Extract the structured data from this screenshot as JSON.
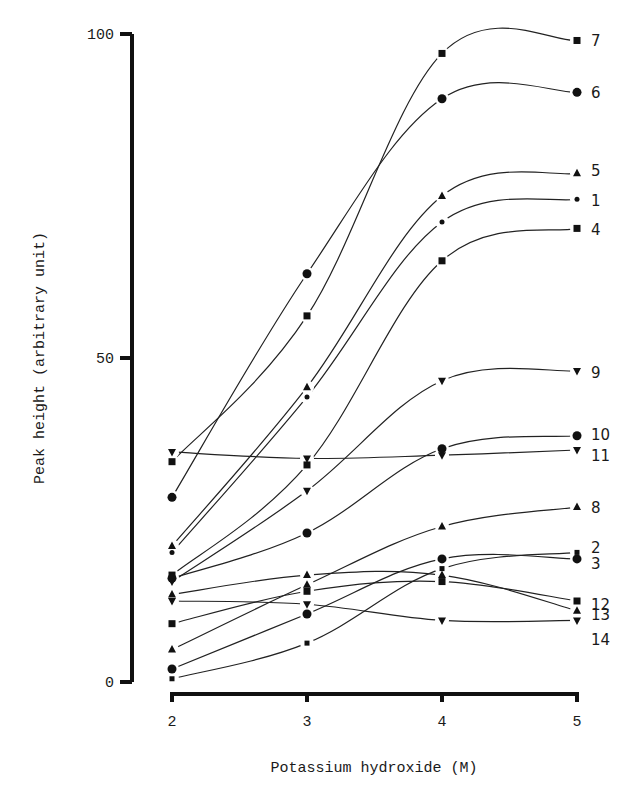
{
  "chart_data": {
    "type": "line",
    "title": "",
    "xlabel": "Potassium hydroxide (M)",
    "ylabel": "Peak height (arbitrary unit)",
    "x": [
      2,
      3,
      4,
      5
    ],
    "xlim": [
      2,
      5
    ],
    "ylim": [
      0,
      100
    ],
    "x_ticks": [
      "2",
      "3",
      "4",
      "5"
    ],
    "y_ticks": [
      "0",
      "50",
      "100"
    ],
    "grid": false,
    "legend": "inline-right",
    "series": [
      {
        "name": "1",
        "marker": "small-circle",
        "values": [
          20,
          44,
          71,
          74.5
        ]
      },
      {
        "name": "2",
        "marker": "small-square",
        "values": [
          0.5,
          6,
          17.5,
          20
        ]
      },
      {
        "name": "3",
        "marker": "circle",
        "values": [
          2,
          10.5,
          19,
          19
        ]
      },
      {
        "name": "4",
        "marker": "square",
        "values": [
          16.5,
          33.5,
          65,
          70
        ]
      },
      {
        "name": "5",
        "marker": "triangle-up",
        "values": [
          21,
          45.5,
          75,
          78.5
        ]
      },
      {
        "name": "6",
        "marker": "circle",
        "values": [
          28.5,
          63,
          90,
          91
        ]
      },
      {
        "name": "7",
        "marker": "square",
        "values": [
          34,
          56.5,
          97,
          99
        ]
      },
      {
        "name": "8",
        "marker": "triangle-up",
        "values": [
          5,
          15,
          24,
          27
        ]
      },
      {
        "name": "9",
        "marker": "triangle-down",
        "values": [
          15.5,
          29.5,
          46.5,
          48
        ]
      },
      {
        "name": "10",
        "marker": "circle",
        "values": [
          16,
          23,
          36,
          38
        ]
      },
      {
        "name": "11",
        "marker": "triangle-down",
        "values": [
          35.5,
          34.5,
          35,
          35.8
        ]
      },
      {
        "name": "12",
        "marker": "square",
        "values": [
          9,
          14,
          15.5,
          12.5
        ]
      },
      {
        "name": "13",
        "marker": "triangle-up",
        "values": [
          13.5,
          16.5,
          16.5,
          11
        ]
      },
      {
        "name": "14",
        "marker": "triangle-down",
        "values": [
          12.5,
          12,
          9.5,
          9.5
        ]
      }
    ]
  }
}
